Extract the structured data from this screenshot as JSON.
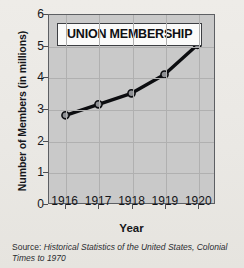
{
  "chart_data": {
    "type": "line",
    "title": "UNION MEMBERSHIP",
    "xlabel": "Year",
    "ylabel": "Number of Members (in millions)",
    "categories": [
      "1916",
      "1917",
      "1918",
      "1919",
      "1920"
    ],
    "values": [
      2.8,
      3.15,
      3.5,
      4.1,
      5.05
    ],
    "series": [
      {
        "name": "Union membership",
        "values": [
          2.8,
          3.15,
          3.5,
          4.1,
          5.05
        ]
      }
    ],
    "xtick_labels": [
      "1916",
      "1917",
      "1918",
      "1919",
      "1920"
    ],
    "ytick_labels": [
      "0",
      "1",
      "2",
      "3",
      "4",
      "5",
      "6"
    ],
    "ytick_values": [
      0,
      1,
      2,
      3,
      4,
      5,
      6
    ],
    "ylim": [
      0,
      6
    ],
    "grid": true,
    "legend": "none",
    "marker": "circle",
    "line_color": "#0c0d10",
    "marker_fill": "#8e9094",
    "plot_background": "#c9c9c9",
    "page_background": "#ebe9e5"
  },
  "source": {
    "label": "Source:",
    "title": "Historical Statistics of the United States, Colonial Times to 1970"
  }
}
